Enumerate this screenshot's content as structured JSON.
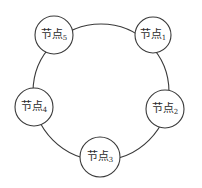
{
  "diagram": {
    "type": "ring-topology",
    "colors": {
      "stroke": "#3a3a3a",
      "text": "#2a2a2a",
      "background": "#ffffff"
    },
    "ring": {
      "cx": 101,
      "cy": 92,
      "r": 68
    },
    "nodes": [
      {
        "id": "1",
        "label": "节点",
        "sub": "1",
        "cx": 153,
        "cy": 35,
        "r": 18
      },
      {
        "id": "2",
        "label": "节点",
        "sub": "2",
        "cx": 165,
        "cy": 109,
        "r": 19
      },
      {
        "id": "3",
        "label": "节点",
        "sub": "3",
        "cx": 100,
        "cy": 157,
        "r": 20
      },
      {
        "id": "4",
        "label": "节点",
        "sub": "4",
        "cx": 34,
        "cy": 107,
        "r": 19
      },
      {
        "id": "5",
        "label": "节点",
        "sub": "5",
        "cx": 54,
        "cy": 35,
        "r": 19
      }
    ]
  }
}
